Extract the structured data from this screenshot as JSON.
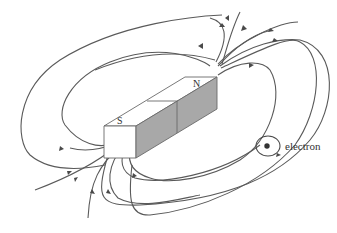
{
  "diagram": {
    "labels": {
      "north_pole": "N",
      "south_pole": "S",
      "electron": "electron"
    },
    "colors": {
      "background": "#ffffff",
      "field_line": "#5a5a5a",
      "magnet_top": "#ffffff",
      "magnet_front_shaded": "#a8a8a8",
      "magnet_edge": "#6a6a6a",
      "electron_dot": "#333333"
    },
    "elements": [
      {
        "type": "bar-magnet",
        "poles": [
          "S",
          "N"
        ]
      },
      {
        "type": "magnetic-field-lines",
        "direction": "from N pole around to S pole"
      },
      {
        "type": "electron-spin-orbit",
        "label": "electron"
      }
    ]
  }
}
